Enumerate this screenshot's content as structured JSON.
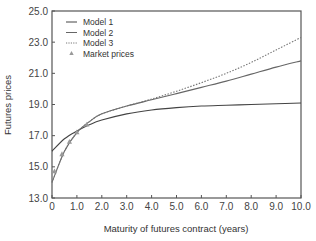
{
  "chart_data": {
    "type": "line",
    "title": "",
    "xlabel": "Maturity of futures contract (years)",
    "ylabel": "Futures prices",
    "xlim": [
      0,
      10
    ],
    "ylim": [
      13,
      25
    ],
    "x_ticks": [
      "0",
      "1.0",
      "2.0",
      "3.0",
      "4.0",
      "5.0",
      "6.0",
      "7.0",
      "8.0",
      "9.0",
      "10.0"
    ],
    "y_ticks": [
      "13.0",
      "15.0",
      "17.0",
      "19.0",
      "21.0",
      "23.0",
      "25.0"
    ],
    "grid": false,
    "legend_position": "upper-left",
    "legend": [
      "Model 1",
      "Model 2",
      "Model 3",
      "Market prices"
    ],
    "x": [
      0,
      0.5,
      1.0,
      1.5,
      2.0,
      3.0,
      4.0,
      5.0,
      6.0,
      7.0,
      8.0,
      9.0,
      10.0
    ],
    "series": [
      {
        "name": "Model 1",
        "style": "solid",
        "color": "#444444",
        "values": [
          16.0,
          16.8,
          17.3,
          17.7,
          18.0,
          18.4,
          18.65,
          18.8,
          18.9,
          18.95,
          19.0,
          19.05,
          19.1
        ]
      },
      {
        "name": "Model 2",
        "style": "solid",
        "color": "#666666",
        "values": [
          14.0,
          16.0,
          17.2,
          17.9,
          18.4,
          18.9,
          19.3,
          19.7,
          20.1,
          20.5,
          20.95,
          21.4,
          21.8
        ]
      },
      {
        "name": "Model 3",
        "style": "dotted",
        "color": "#777777",
        "values": [
          14.0,
          16.0,
          17.2,
          17.9,
          18.4,
          18.9,
          19.35,
          19.85,
          20.4,
          21.0,
          21.7,
          22.5,
          23.3
        ]
      }
    ],
    "markers": {
      "name": "Market prices",
      "symbol": "triangle",
      "color": "#999999",
      "x": [
        0.1,
        0.4,
        0.7,
        1.0,
        1.4
      ],
      "y": [
        14.7,
        15.8,
        16.6,
        17.2,
        17.7
      ]
    }
  }
}
